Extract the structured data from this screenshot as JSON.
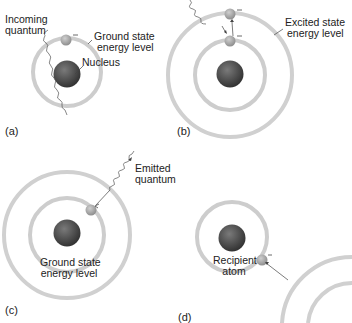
{
  "panels": [
    {
      "id": "a",
      "tag": "(a)",
      "labels": {
        "incoming": [
          "Incoming",
          "quantum"
        ],
        "ground": [
          "Ground state",
          "energy level"
        ],
        "nucleus": "Nucleus"
      },
      "charge": "–"
    },
    {
      "id": "b",
      "tag": "(b)",
      "labels": {
        "excited": [
          "Excited state",
          "energy level"
        ]
      },
      "charge": "–"
    },
    {
      "id": "c",
      "tag": "(c)",
      "labels": {
        "emitted": [
          "Emitted",
          "quantum"
        ],
        "ground": [
          "Ground state",
          "energy level"
        ]
      },
      "charge": "–"
    },
    {
      "id": "d",
      "tag": "(d)",
      "labels": {
        "recipient": [
          "Recipient",
          "atom"
        ]
      },
      "charge": "–"
    }
  ],
  "colors": {
    "ring": "#c9c9c9",
    "nucleus": "#4a4a4a",
    "electron": "#a8a8a8",
    "line": "#555555"
  }
}
